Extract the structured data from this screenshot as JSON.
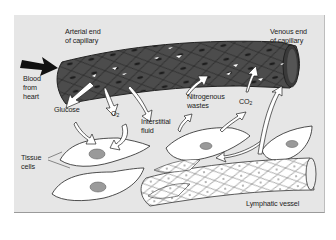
{
  "diagram": {
    "title": "",
    "labels": {
      "arterial_end": [
        "Arterial end",
        "of capillary"
      ],
      "venous_end": [
        "Venous end",
        "of capillary"
      ],
      "blood_from_heart": [
        "Blood",
        "from",
        "heart"
      ],
      "glucose": "Glucose",
      "oxygen": "O",
      "oxygen_sub": "2",
      "interstitial_fluid": [
        "Interstitial",
        "fluid"
      ],
      "nitrogenous_wastes": [
        "Nitrogenous",
        "wastes"
      ],
      "carbon_dioxide": "CO",
      "carbon_dioxide_sub": "2",
      "tissue_cells": [
        "Tissue",
        "cells"
      ],
      "lymphatic_vessel": "Lymphatic vessel"
    },
    "components": [
      "capillary",
      "tissue-cell",
      "tissue-cell",
      "tissue-cell",
      "tissue-cell",
      "lymphatic-vessel"
    ],
    "flows": [
      {
        "from": "heart",
        "to": "capillary",
        "label": "Blood from heart"
      },
      {
        "from": "capillary",
        "to": "tissue-cells",
        "label": "Glucose"
      },
      {
        "from": "capillary",
        "to": "tissue-cells",
        "label": "O2"
      },
      {
        "from": "capillary",
        "to": "interstitial-space",
        "label": "Interstitial fluid"
      },
      {
        "from": "tissue-cells",
        "to": "capillary",
        "label": "Nitrogenous wastes"
      },
      {
        "from": "tissue-cells",
        "to": "capillary",
        "label": "CO2"
      },
      {
        "from": "interstitial-space",
        "to": "lymphatic-vessel",
        "label": ""
      }
    ],
    "colors": {
      "background": "#e6e6e6",
      "capillary": "#4a4a4a",
      "capillary_dark": "#2e2e2e",
      "cell_fill": "#ffffff",
      "nucleus": "#9a9a9a",
      "arrow": "#ffffff",
      "heart_arrow": "#111111"
    }
  }
}
